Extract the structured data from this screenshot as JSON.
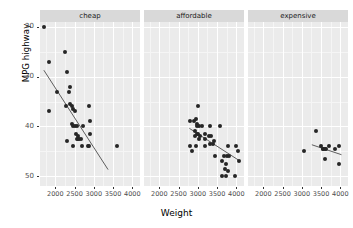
{
  "chart_data": {
    "type": "scatter",
    "title": "",
    "xlabel": "Weight",
    "ylabel": "MPG highway",
    "xlim": [
      1600,
      4200
    ],
    "ylim": [
      18,
      51
    ],
    "xticks": [
      2000,
      2500,
      3000,
      3500,
      4000
    ],
    "yticks": [
      20,
      30,
      40,
      50
    ],
    "grid": true,
    "legend": "none",
    "facet_variable": "price category",
    "facets": [
      {
        "label": "cheap",
        "points": [
          {
            "x": 1695,
            "y": 50.0
          },
          {
            "x": 1845,
            "y": 43.0
          },
          {
            "x": 2255,
            "y": 45.0
          },
          {
            "x": 2295,
            "y": 41.0
          },
          {
            "x": 2035,
            "y": 37.0
          },
          {
            "x": 2350,
            "y": 37.0
          },
          {
            "x": 2390,
            "y": 38.0
          },
          {
            "x": 1845,
            "y": 33.0
          },
          {
            "x": 2280,
            "y": 34.0
          },
          {
            "x": 2385,
            "y": 34.5
          },
          {
            "x": 2440,
            "y": 34.0
          },
          {
            "x": 2450,
            "y": 33.5
          },
          {
            "x": 2500,
            "y": 33.0
          },
          {
            "x": 2865,
            "y": 34.0
          },
          {
            "x": 2420,
            "y": 30.5
          },
          {
            "x": 2455,
            "y": 30.0
          },
          {
            "x": 2510,
            "y": 30.0
          },
          {
            "x": 2560,
            "y": 30.0
          },
          {
            "x": 2705,
            "y": 30.0
          },
          {
            "x": 2895,
            "y": 31.0
          },
          {
            "x": 2290,
            "y": 27.0
          },
          {
            "x": 2545,
            "y": 28.5
          },
          {
            "x": 2600,
            "y": 28.0
          },
          {
            "x": 2560,
            "y": 27.5
          },
          {
            "x": 2590,
            "y": 27.5
          },
          {
            "x": 2620,
            "y": 27.5
          },
          {
            "x": 2660,
            "y": 27.5
          },
          {
            "x": 2900,
            "y": 28.5
          },
          {
            "x": 2465,
            "y": 26.0
          },
          {
            "x": 2700,
            "y": 26.0
          },
          {
            "x": 2840,
            "y": 26.0
          },
          {
            "x": 2880,
            "y": 26.0
          },
          {
            "x": 3605,
            "y": 26.0
          }
        ],
        "fit": {
          "x1": 1700,
          "y1": 41.3,
          "x2": 3370,
          "y2": 21.3
        }
      },
      {
        "label": "affordable",
        "points": [
          {
            "x": 3005,
            "y": 34.0
          },
          {
            "x": 2800,
            "y": 31.0
          },
          {
            "x": 2900,
            "y": 31.0
          },
          {
            "x": 2955,
            "y": 31.5
          },
          {
            "x": 2990,
            "y": 30.5
          },
          {
            "x": 2985,
            "y": 30.0
          },
          {
            "x": 3030,
            "y": 30.0
          },
          {
            "x": 3100,
            "y": 30.0
          },
          {
            "x": 3310,
            "y": 30.0
          },
          {
            "x": 3570,
            "y": 30.0
          },
          {
            "x": 2930,
            "y": 29.0
          },
          {
            "x": 2975,
            "y": 28.5
          },
          {
            "x": 3010,
            "y": 28.5
          },
          {
            "x": 3060,
            "y": 28.0
          },
          {
            "x": 3175,
            "y": 28.5
          },
          {
            "x": 2930,
            "y": 28.0
          },
          {
            "x": 3020,
            "y": 27.5
          },
          {
            "x": 3180,
            "y": 27.5
          },
          {
            "x": 3280,
            "y": 28.0
          },
          {
            "x": 3340,
            "y": 28.0
          },
          {
            "x": 3420,
            "y": 27.0
          },
          {
            "x": 2800,
            "y": 26.0
          },
          {
            "x": 2845,
            "y": 25.0
          },
          {
            "x": 2960,
            "y": 26.0
          },
          {
            "x": 3180,
            "y": 26.0
          },
          {
            "x": 3320,
            "y": 26.5
          },
          {
            "x": 3395,
            "y": 26.5
          },
          {
            "x": 3790,
            "y": 26.0
          },
          {
            "x": 4000,
            "y": 26.0
          },
          {
            "x": 3440,
            "y": 24.0
          },
          {
            "x": 3690,
            "y": 24.0
          },
          {
            "x": 3760,
            "y": 24.0
          },
          {
            "x": 3810,
            "y": 24.0
          },
          {
            "x": 4055,
            "y": 25.0
          },
          {
            "x": 3625,
            "y": 23.0
          },
          {
            "x": 3720,
            "y": 22.5
          },
          {
            "x": 4065,
            "y": 23.0
          },
          {
            "x": 3705,
            "y": 21.5
          },
          {
            "x": 3790,
            "y": 21.0
          },
          {
            "x": 3640,
            "y": 20.0
          },
          {
            "x": 3740,
            "y": 20.0
          },
          {
            "x": 3960,
            "y": 20.0
          }
        ],
        "fit": {
          "x1": 2780,
          "y1": 29.6,
          "x2": 4060,
          "y2": 23.2
        }
      },
      {
        "label": "expensive",
        "points": [
          {
            "x": 3380,
            "y": 29.0
          },
          {
            "x": 3055,
            "y": 25.0
          },
          {
            "x": 3510,
            "y": 26.0
          },
          {
            "x": 3545,
            "y": 25.5
          },
          {
            "x": 3560,
            "y": 25.5
          },
          {
            "x": 3600,
            "y": 25.5
          },
          {
            "x": 3620,
            "y": 25.5
          },
          {
            "x": 3715,
            "y": 26.0
          },
          {
            "x": 3855,
            "y": 25.5
          },
          {
            "x": 3955,
            "y": 26.0
          },
          {
            "x": 3600,
            "y": 23.5
          },
          {
            "x": 3960,
            "y": 22.5
          }
        ],
        "fit": {
          "x1": 3260,
          "y1": 26.3,
          "x2": 4030,
          "y2": 24.3
        }
      }
    ]
  },
  "axes": {
    "y_title": "MPG highway",
    "x_title": "Weight",
    "y_tick_labels": [
      "50",
      "40",
      "30",
      "20"
    ],
    "x_tick_labels": [
      "2000",
      "2500",
      "3000",
      "3500",
      "4000"
    ]
  },
  "colors": {
    "panel_background": "#ebebeb",
    "strip_background": "#d9d9d9",
    "gridline": "#ffffff",
    "point": "#262626",
    "fitline": "#4d4d4d",
    "text": "#000000",
    "tick_text": "#4d4d4d"
  }
}
